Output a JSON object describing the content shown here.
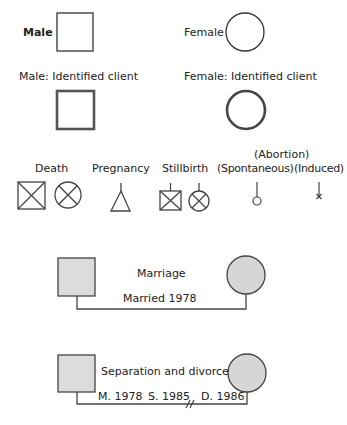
{
  "legend": {
    "male": "Male",
    "female": "Female",
    "male_identified": "Male: Identified client",
    "female_identified": "Female: Identified client",
    "death": "Death",
    "pregnancy": "Pregnancy",
    "stillbirth": "Stillbirth",
    "abortion": "(Abortion)",
    "spontaneous": "(Spontaneous)",
    "induced": "(Induced)"
  },
  "marriage": {
    "title": "Marriage",
    "label": "Married 1978"
  },
  "divorce": {
    "title": "Separation and divorce",
    "married": "M. 1978",
    "separated": "S. 1985",
    "divorced": "D. 1986"
  },
  "colors": {
    "stroke": "#333333",
    "fill_gray": "#d9d9d9"
  }
}
